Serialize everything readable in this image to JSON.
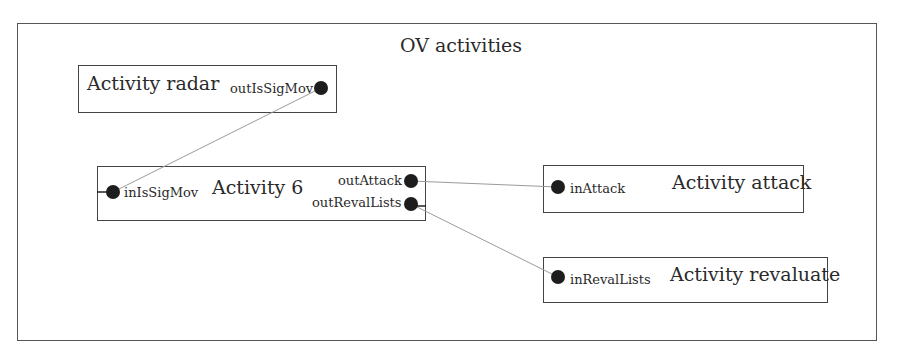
{
  "diagram": {
    "title": "OV activities",
    "activities": [
      {
        "id": "radar",
        "label": "Activity radar",
        "ports": [
          {
            "label": "outIsSigMov",
            "direction": "out"
          }
        ]
      },
      {
        "id": "act6",
        "label": "Activity 6",
        "ports": [
          {
            "label": "inIsSigMov",
            "direction": "in"
          },
          {
            "label": "outAttack",
            "direction": "out"
          },
          {
            "label": "outRevalLists",
            "direction": "out"
          }
        ]
      },
      {
        "id": "attack",
        "label": "Activity attack",
        "ports": [
          {
            "label": "inAttack",
            "direction": "in"
          }
        ]
      },
      {
        "id": "revaluate",
        "label": "Activity revaluate",
        "ports": [
          {
            "label": "inRevalLists",
            "direction": "in"
          }
        ]
      }
    ],
    "connections": [
      {
        "from": "outIsSigMov",
        "to": "inIsSigMov"
      },
      {
        "from": "outAttack",
        "to": "inAttack"
      },
      {
        "from": "outRevalLists",
        "to": "inRevalLists"
      }
    ],
    "colors": {
      "frame": "#555555",
      "box": "#444444",
      "wire": "#9a9a9a",
      "port": "#1d1d1d"
    }
  }
}
